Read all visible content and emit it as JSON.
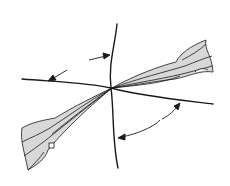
{
  "diagram": {
    "colors": {
      "stroke": "#1a1a1a",
      "fill": "#d8d8d8",
      "background": "#ffffff"
    },
    "elements": [
      "vertical-cord",
      "horizontal-cord",
      "fiber-bundle-upper-right",
      "fiber-bundle-lower-left",
      "arrow-upper",
      "arrow-left",
      "arrow-curved-double"
    ]
  }
}
